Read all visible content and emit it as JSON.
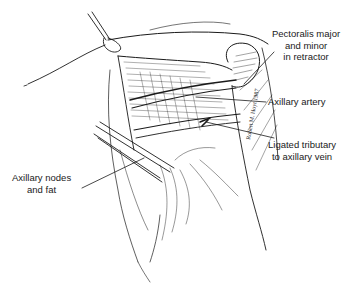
{
  "figure": {
    "type": "surgical anatomical illustration",
    "line_color": "#1a1a1a",
    "background": "#ffffff"
  },
  "labels": {
    "pectoralis": {
      "lines": [
        "Pectoralis major",
        "and minor",
        "in retractor"
      ]
    },
    "axillary_artery": {
      "lines": [
        "Axillary artery"
      ]
    },
    "ligated_tributary": {
      "lines": [
        "Ligated tributary",
        "to axillary vein"
      ]
    },
    "axillary_nodes": {
      "lines": [
        "Axillary nodes",
        "and fat"
      ]
    }
  },
  "signature": {
    "text": "Robert M. Hoyt 1987"
  }
}
